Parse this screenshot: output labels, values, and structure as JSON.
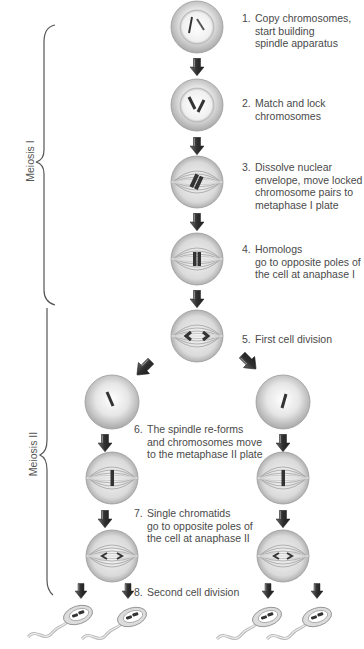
{
  "diagram": {
    "title": "Meiosis",
    "phases": [
      {
        "id": "meiosis-1",
        "label": "Meiosis I"
      },
      {
        "id": "meiosis-2",
        "label": "Meiosis II"
      }
    ],
    "steps": [
      {
        "number": "1.",
        "lines": [
          "Copy chromosomes,",
          "start building",
          "spindle apparatus"
        ]
      },
      {
        "number": "2.",
        "lines": [
          "Match and lock",
          "chromosomes"
        ]
      },
      {
        "number": "3.",
        "lines": [
          "Dissolve nuclear",
          "envelope, move locked",
          "chromosome pairs to",
          "metaphase I plate"
        ]
      },
      {
        "number": "4.",
        "lines": [
          "Homologs",
          "go to opposite poles of",
          "the cell at anaphase I"
        ]
      },
      {
        "number": "5.",
        "lines": [
          "First cell division"
        ]
      },
      {
        "number": "6.",
        "lines": [
          "The spindle re-forms",
          "and chromosomes move",
          "to the metaphase II plate"
        ]
      },
      {
        "number": "7.",
        "lines": [
          "Single chromatids",
          "go to opposite poles of",
          "the cell at anaphase II"
        ]
      },
      {
        "number": "8.",
        "lines": [
          "Second cell division"
        ]
      }
    ],
    "colors": {
      "text": "#4a4a4a",
      "cell_fill": "#d8d8d8",
      "cell_edge": "#9a9a9a",
      "arrow": "#3a3a3a",
      "chromosome": "#444444",
      "brace": "#555555"
    }
  }
}
